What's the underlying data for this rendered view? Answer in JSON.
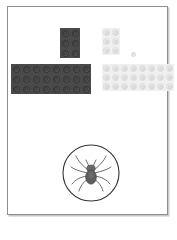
{
  "page": {
    "background_color": "#ffffff",
    "canvas": {
      "name": "worksheet-card",
      "border_color": "#8e8e8e",
      "fill_color": "#ffffff",
      "shadow_color": "#c9c9c9",
      "x": 7,
      "y": 6,
      "width": 161,
      "height": 209
    }
  },
  "pieces": [
    {
      "id": "dark-corner-piece",
      "label": "Dark grey L-shaped brick assembly",
      "color": "#4a4a4a",
      "stud_color": "#565656",
      "shape": "L",
      "vertical_arm": {
        "x": 59,
        "y": 27,
        "cols": 2,
        "rows": 3
      },
      "horizontal_arm": {
        "x": 10,
        "y": 63,
        "cols": 8,
        "rows": 3
      },
      "stud_count": 30,
      "stud_pitch": 10
    },
    {
      "id": "light-corner-piece",
      "label": "Light grey L-shaped brick assembly",
      "color": "#f0f0f0",
      "stud_color": "#ebebeb",
      "shape": "L",
      "vertical_arm": {
        "x": 101,
        "y": 27,
        "cols": 2,
        "rows": 3
      },
      "horizontal_arm": {
        "x": 101,
        "y": 63,
        "cols": 8,
        "rows": 3
      },
      "stud_count": 30,
      "stud_pitch": 9
    }
  ],
  "loose_stud": {
    "id": "loose-stud",
    "label": "Single detached stud",
    "color": "#e8e8e8",
    "x": 130,
    "y": 51,
    "size": 5
  },
  "badge": {
    "id": "spider-badge",
    "label": "Spider emblem",
    "shape": "circle",
    "outline_color": "#333333",
    "fill_color": "#ffffff",
    "icon_name": "spider-icon",
    "icon_color": "#555555",
    "x": 61,
    "y": 143,
    "diameter": 58
  },
  "chart_data": {
    "type": "table",
    "columns": [
      "piece",
      "arm",
      "columns",
      "rows",
      "studs"
    ],
    "rows": [
      [
        "dark-corner-piece",
        "vertical",
        2,
        3,
        6
      ],
      [
        "dark-corner-piece",
        "horizontal",
        8,
        3,
        24
      ],
      [
        "light-corner-piece",
        "vertical",
        2,
        3,
        6
      ],
      [
        "light-corner-piece",
        "horizontal",
        8,
        3,
        24
      ],
      [
        "loose-stud",
        "none",
        1,
        1,
        1
      ]
    ]
  }
}
